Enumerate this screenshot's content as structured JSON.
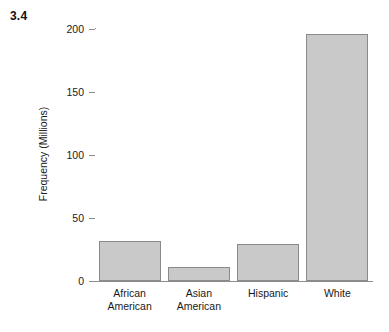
{
  "figure": {
    "label": "3.4"
  },
  "chart_data": {
    "type": "bar",
    "title": "",
    "subtitle": "",
    "xlabel": "",
    "ylabel": "Frequency (Millions)",
    "categories": [
      "African American",
      "Asian American",
      "Hispanic",
      "White"
    ],
    "category_lines": [
      [
        "African",
        "American"
      ],
      [
        "Asian",
        "American"
      ],
      [
        "Hispanic"
      ],
      [
        "White"
      ]
    ],
    "values": [
      32,
      11,
      29,
      196
    ],
    "ylim": [
      0,
      200
    ],
    "yticks": [
      0,
      50,
      100,
      150,
      200
    ],
    "ytick_labels": [
      "0",
      "50",
      "100",
      "150",
      "200"
    ],
    "grid": false,
    "legend": false,
    "legend_position": "none",
    "bar_fill_color": "#c9c9c9",
    "bar_border_color": "#8a8a8a",
    "axis_color": "#8d8d8d",
    "background_color": "#ffffff"
  }
}
